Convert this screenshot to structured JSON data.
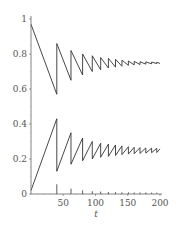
{
  "chart_data": {
    "type": "line",
    "title": "",
    "xlabel": "t",
    "ylabel": "",
    "xlim": [
      0,
      200
    ],
    "ylim": [
      0,
      1
    ],
    "grid": false,
    "legend": null,
    "x_ticks": [
      "50",
      "100",
      "150",
      "200"
    ],
    "x_tick_values": [
      50,
      100,
      150,
      200
    ],
    "y_ticks": [
      "0",
      "0.2",
      "0.4",
      "0.6",
      "0.8",
      "1"
    ],
    "y_tick_values": [
      0,
      0.2,
      0.4,
      0.6,
      0.8,
      1.0
    ],
    "series": [
      {
        "name": "upper",
        "x": [
          0,
          40,
          40,
          62,
          62,
          80,
          80,
          95,
          95,
          108,
          108,
          120,
          120,
          131,
          131,
          141,
          141,
          151,
          151,
          160,
          160,
          169,
          169,
          178,
          178,
          187,
          187,
          195,
          195,
          200
        ],
        "values": [
          0.97,
          0.57,
          0.86,
          0.65,
          0.82,
          0.68,
          0.8,
          0.7,
          0.79,
          0.71,
          0.78,
          0.72,
          0.775,
          0.725,
          0.77,
          0.73,
          0.765,
          0.735,
          0.76,
          0.738,
          0.758,
          0.74,
          0.756,
          0.742,
          0.755,
          0.744,
          0.754,
          0.745,
          0.753,
          0.746
        ]
      },
      {
        "name": "lower",
        "x": [
          0,
          40,
          40,
          62,
          62,
          80,
          80,
          95,
          95,
          108,
          108,
          120,
          120,
          131,
          131,
          141,
          141,
          151,
          151,
          160,
          160,
          169,
          169,
          178,
          178,
          187,
          187,
          195,
          195,
          200
        ],
        "values": [
          0.02,
          0.43,
          0.13,
          0.35,
          0.17,
          0.32,
          0.19,
          0.3,
          0.2,
          0.29,
          0.21,
          0.285,
          0.215,
          0.28,
          0.22,
          0.275,
          0.225,
          0.27,
          0.228,
          0.267,
          0.23,
          0.265,
          0.232,
          0.263,
          0.234,
          0.262,
          0.236,
          0.261,
          0.237,
          0.258
        ]
      },
      {
        "name": "impulses",
        "x": [
          40,
          62,
          80,
          95,
          108,
          120,
          131,
          141,
          151,
          160,
          169,
          178,
          187,
          195
        ],
        "values": [
          0.05,
          0.025,
          0.015,
          0.01,
          0.008,
          0.006,
          0.005,
          0.004,
          0.004,
          0.003,
          0.003,
          0.003,
          0.002,
          0.002
        ]
      }
    ]
  },
  "colors": {
    "line": "#333333",
    "axis": "#666666",
    "text": "#555555"
  }
}
